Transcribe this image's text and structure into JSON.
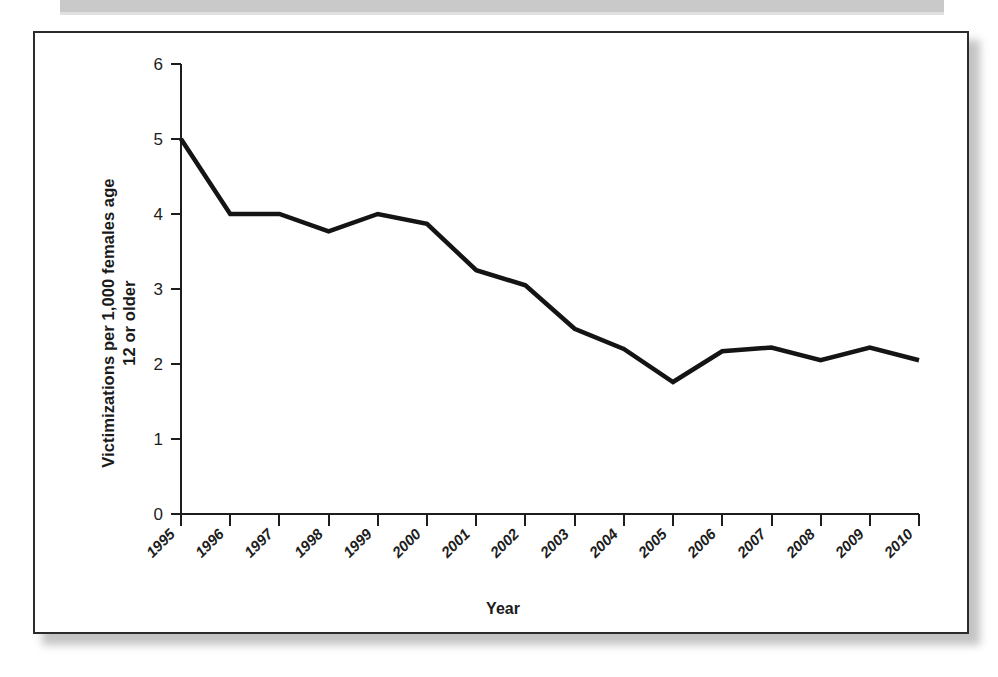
{
  "figure": {
    "border_color": "#2b2b2b",
    "background": "#ffffff",
    "line_color": "#141414"
  },
  "chart_data": {
    "type": "line",
    "title": "",
    "xlabel": "Year",
    "ylabel": "Victimizations per 1,000 females age 12 or older",
    "ylabel_line1": "Victimizations per 1,000 females age",
    "ylabel_line2": "12 or older",
    "categories": [
      "1995",
      "1996",
      "1997",
      "1998",
      "1999",
      "2000",
      "2001",
      "2002",
      "2003",
      "2004",
      "2005",
      "2006",
      "2007",
      "2008",
      "2009",
      "2010"
    ],
    "values": [
      5.0,
      4.0,
      4.0,
      3.77,
      4.0,
      3.87,
      3.25,
      3.05,
      2.47,
      2.2,
      1.76,
      2.17,
      2.22,
      2.05,
      2.22,
      2.05
    ],
    "series": [
      {
        "name": "Victimizations per 1,000 females age 12 or older",
        "values": [
          5.0,
          4.0,
          4.0,
          3.77,
          4.0,
          3.87,
          3.25,
          3.05,
          2.47,
          2.2,
          1.76,
          2.17,
          2.22,
          2.05,
          2.22,
          2.05
        ]
      }
    ],
    "yticks": [
      0,
      1,
      2,
      3,
      4,
      5,
      6
    ],
    "ytick_labels": [
      "0",
      "1",
      "2",
      "3",
      "4",
      "5",
      "6"
    ],
    "ylim": [
      0,
      6
    ],
    "xlim": [
      "1995",
      "2010"
    ],
    "grid": false,
    "legend": false,
    "legend_position": "none",
    "xtick_rotation": -45
  }
}
